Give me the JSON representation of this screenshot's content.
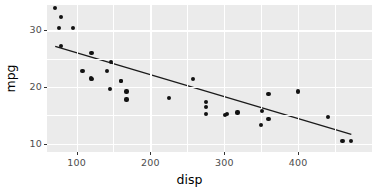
{
  "chart_data": {
    "type": "scatter",
    "title": "",
    "subtitle": "",
    "xlabel": "disp",
    "ylabel": "mpg",
    "xlim": [
      60,
      500
    ],
    "ylim": [
      8.5,
      34.5
    ],
    "xticks": [
      100,
      200,
      300,
      400
    ],
    "xtick_labels": [
      "100",
      "200",
      "300",
      "400"
    ],
    "yticks": [
      10,
      20,
      30
    ],
    "ytick_labels": [
      "10",
      "20",
      "30"
    ],
    "grid": true,
    "legend": "none",
    "panel_background": "#ebebeb",
    "grid_color": "#ffffff",
    "point_color": "#121212",
    "line_color": "#1a1a1a",
    "series": [
      {
        "name": "mtcars",
        "marker": "circle",
        "x": [
          160,
          160,
          108,
          258,
          360,
          225,
          360,
          146.7,
          140.8,
          167.6,
          167.6,
          275.8,
          275.8,
          275.8,
          472,
          460,
          440,
          78.7,
          75.7,
          71.1,
          120.1,
          318,
          304,
          350,
          400,
          79,
          120.3,
          95.1,
          351,
          145,
          301,
          121
        ],
        "y": [
          21.0,
          21.0,
          22.8,
          21.4,
          18.7,
          18.1,
          14.3,
          24.4,
          22.8,
          19.2,
          17.8,
          16.4,
          17.3,
          15.2,
          10.4,
          10.4,
          14.7,
          32.4,
          30.4,
          33.9,
          21.5,
          15.5,
          15.2,
          13.3,
          19.2,
          27.3,
          26.0,
          30.4,
          15.8,
          19.7,
          15.0,
          21.4
        ]
      }
    ],
    "fit_line": {
      "type": "linear-regression",
      "x0": 71.1,
      "y0": 27.2,
      "x1": 472,
      "y1": 11.6
    }
  },
  "axes": {
    "x_title": "disp",
    "y_title": "mpg"
  }
}
